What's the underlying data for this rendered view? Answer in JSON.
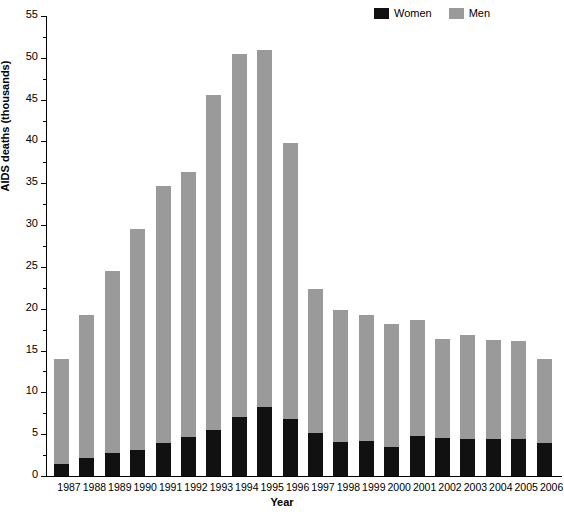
{
  "chart_data": {
    "type": "bar",
    "stacked": true,
    "title": "",
    "xlabel": "Year",
    "ylabel": "AIDS deaths (thousands)",
    "categories": [
      "1987",
      "1988",
      "1989",
      "1990",
      "1991",
      "1992",
      "1993",
      "1994",
      "1995",
      "1996",
      "1997",
      "1998",
      "1999",
      "2000",
      "2001",
      "2002",
      "2003",
      "2004",
      "2005",
      "2006"
    ],
    "series": [
      {
        "name": "Women",
        "color": "#111111",
        "values": [
          1.4,
          2.1,
          2.7,
          3.1,
          3.9,
          4.7,
          5.5,
          7.1,
          8.2,
          6.8,
          5.2,
          4.1,
          4.2,
          3.5,
          4.8,
          4.6,
          4.4,
          4.4,
          4.4,
          3.9
        ]
      },
      {
        "name": "Men",
        "color": "#9a9a9a",
        "values": [
          12.6,
          17.2,
          21.8,
          26.4,
          30.8,
          31.6,
          40.0,
          43.3,
          42.7,
          33.0,
          17.2,
          15.8,
          15.0,
          14.7,
          13.9,
          11.8,
          12.5,
          11.9,
          11.8,
          10.1
        ]
      }
    ],
    "totals": [
      14.0,
      19.3,
      24.5,
      29.5,
      34.7,
      36.3,
      45.5,
      50.4,
      50.9,
      39.8,
      22.4,
      19.9,
      19.2,
      18.2,
      18.7,
      16.4,
      16.9,
      16.3,
      16.2,
      14.0
    ],
    "ylim": [
      0,
      55
    ],
    "ymajor_step": 5,
    "yminor_step": 2.5,
    "ytick_labels": [
      "0",
      "5",
      "10",
      "15",
      "20",
      "25",
      "30",
      "35",
      "40",
      "45",
      "50",
      "55"
    ],
    "grid": false,
    "legend_position": "top-right"
  },
  "legend": {
    "entries": [
      {
        "label": "Women",
        "color": "#111111"
      },
      {
        "label": "Men",
        "color": "#9a9a9a"
      }
    ]
  },
  "axes": {
    "x_title": "Year",
    "y_title": "AIDS deaths (thousands)"
  }
}
